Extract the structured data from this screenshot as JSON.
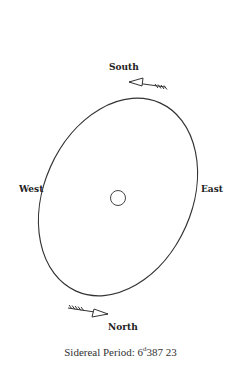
{
  "labels": {
    "south": "South",
    "north": "North",
    "west": "West",
    "east": "East"
  },
  "caption": {
    "prefix": "Sidereal Period:",
    "days": "6",
    "unit": "d",
    "fraction": "387 23"
  },
  "colors": {
    "stroke": "#333333",
    "text": "#222222",
    "background": "#ffffff"
  }
}
